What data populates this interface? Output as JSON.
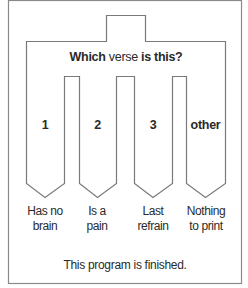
{
  "diagram": {
    "type": "switch-case flowchart",
    "title": {
      "part1": "Which",
      "part2": "verse",
      "part3": "is this?"
    },
    "cases": [
      {
        "value": "1",
        "result_line1": "Has no",
        "result_line2": "brain"
      },
      {
        "value": "2",
        "result_line1": "Is a",
        "result_line2": "pain"
      },
      {
        "value": "3",
        "result_line1": "Last",
        "result_line2": "refrain"
      },
      {
        "value": "other",
        "result_line1": "Nothing",
        "result_line2": "to print"
      }
    ],
    "footer": "This program is finished.",
    "colors": {
      "stroke": "#7a7a7a",
      "text": "#2a2a2a",
      "background": "#ffffff"
    }
  }
}
